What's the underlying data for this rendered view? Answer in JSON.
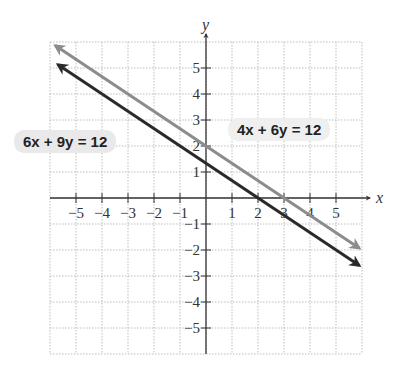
{
  "chart_data": {
    "type": "line",
    "title": "",
    "xlabel": "x",
    "ylabel": "y",
    "xlim": [
      -6,
      6
    ],
    "ylim": [
      -6,
      6
    ],
    "grid": true,
    "xticks": [
      -5,
      -4,
      -3,
      -2,
      -1,
      1,
      2,
      3,
      4,
      5
    ],
    "yticks": [
      -5,
      -4,
      -3,
      -2,
      -1,
      1,
      2,
      3,
      4,
      5
    ],
    "series": [
      {
        "name": "4x + 6y = 12",
        "color": "#8c8c8c",
        "slope": -0.6667,
        "intercept": 2,
        "x_range": [
          -5.8,
          5.9
        ]
      },
      {
        "name": "6x + 9y = 12",
        "color": "#2a2a2a",
        "slope": -0.6667,
        "intercept": 1.3333,
        "x_range": [
          -5.7,
          5.9
        ]
      }
    ],
    "annotations": [
      {
        "label": "6x + 9y = 12",
        "series": 1,
        "placement": "left"
      },
      {
        "label": "4x + 6y = 12",
        "series": 0,
        "placement": "right"
      }
    ]
  }
}
